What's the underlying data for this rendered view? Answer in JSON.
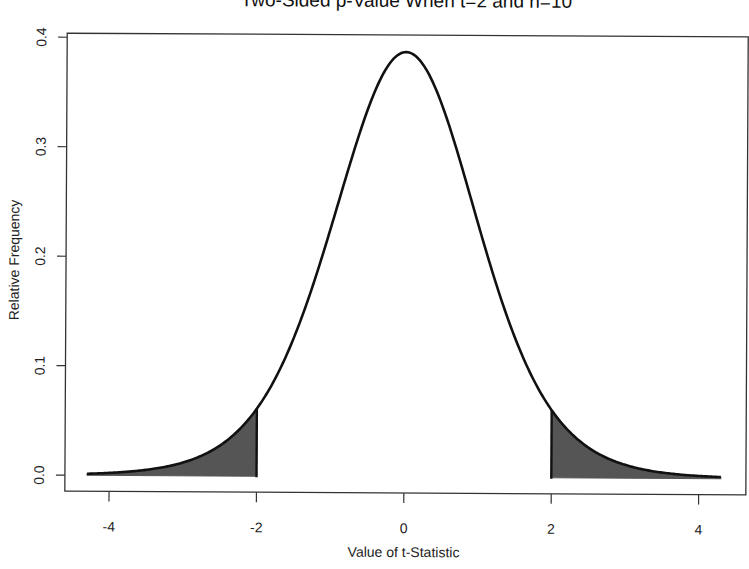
{
  "chart_data": {
    "type": "line",
    "title": "Two-Sided p-Value When t=2 and n=10",
    "xlabel": "Value of t-Statistic",
    "ylabel": "Relative Frequency",
    "distribution": "Student t",
    "degrees_of_freedom": 9,
    "t_observed": 2,
    "n": 10,
    "xlim": [
      -4.3,
      4.3
    ],
    "ylim": [
      0.0,
      0.4
    ],
    "x_ticks": [
      -4,
      -2,
      0,
      2,
      4
    ],
    "x_tick_labels": [
      "-4",
      "-2",
      "0",
      "2",
      "4"
    ],
    "y_ticks": [
      0.0,
      0.1,
      0.2,
      0.3,
      0.4
    ],
    "y_tick_labels": [
      "0.0",
      "0.1",
      "0.2",
      "0.3",
      "0.4"
    ],
    "shaded_regions": [
      {
        "from": -4.3,
        "to": -2,
        "label": "lower tail"
      },
      {
        "from": 2,
        "to": 4.3,
        "label": "upper tail"
      }
    ],
    "sample_points": {
      "x": [
        -4,
        -3,
        -2,
        -1,
        0,
        1,
        2,
        3,
        4
      ],
      "density": [
        0.0038,
        0.0145,
        0.0611,
        0.2304,
        0.388,
        0.2304,
        0.0611,
        0.0145,
        0.0038
      ]
    },
    "grid": false,
    "legend": null,
    "colors": {
      "curve": "#111111",
      "shade": "#555555",
      "axis": "#333333"
    }
  }
}
